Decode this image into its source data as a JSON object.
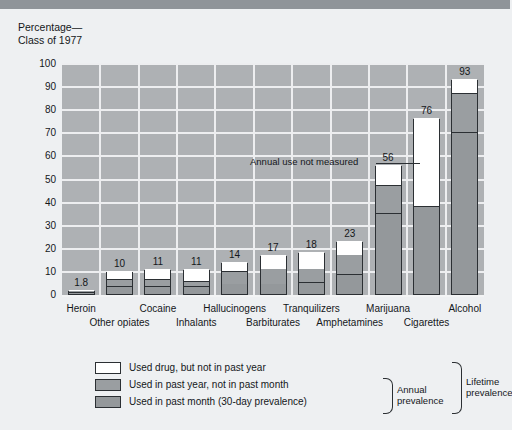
{
  "title": "Percentage—\nClass of 1977",
  "chart_data": {
    "type": "bar",
    "xlabel": "",
    "ylabel": "Percentage—Class of 1977",
    "ylim": [
      0,
      100
    ],
    "yticks": [
      0,
      10,
      20,
      30,
      40,
      50,
      60,
      70,
      80,
      90,
      100
    ],
    "grid": true,
    "stacked": true,
    "legend_position": "below-plot-left",
    "categories": [
      "Heroin",
      "Other opiates",
      "Cocaine",
      "Inhalants",
      "Hallucinogens",
      "Barbiturates",
      "Tranquilizers",
      "Amphetamines",
      "Marijuana",
      "Cigarettes",
      "Alcohol"
    ],
    "lifetime_totals": [
      1.8,
      10,
      11,
      11,
      14,
      17,
      18,
      23,
      56,
      76,
      93
    ],
    "data_labels": [
      "1.8",
      "10",
      "11",
      "11",
      "14",
      "17",
      "18",
      "23",
      "56",
      "76",
      "93"
    ],
    "series": [
      {
        "name": "Used in past month (30-day prevalence)",
        "color": "#94989b",
        "values": [
          0.8,
          3.5,
          3.5,
          3.5,
          4.5,
          4.5,
          5.0,
          8.5,
          35.0,
          38.0,
          70.0
        ]
      },
      {
        "name": "Used in past year, not in past month",
        "color": "#9a9ea1",
        "values": [
          0.6,
          3.0,
          3.0,
          2.0,
          5.5,
          6.5,
          6.0,
          8.5,
          12.0,
          0.0,
          17.0
        ]
      },
      {
        "name": "Used drug, but not in past year",
        "color": "#ffffff",
        "values": [
          0.4,
          3.5,
          4.5,
          5.5,
          4.0,
          6.0,
          7.0,
          6.0,
          9.0,
          38.0,
          6.0
        ]
      }
    ],
    "annotations": [
      {
        "text": "Annual use not measured",
        "target_category": "Cigarettes"
      }
    ]
  },
  "legend": {
    "items": [
      {
        "label": "Used drug, but not in past year",
        "swatch": "white"
      },
      {
        "label": "Used in past year, not in past month",
        "swatch": "gray-year"
      },
      {
        "label": "Used in past month (30-day prevalence)",
        "swatch": "gray-month"
      }
    ],
    "brace_annual": "Annual\nprevalence",
    "brace_lifetime": "Lifetime\nprevalence"
  },
  "colors": {
    "plot_background": "#aeb1b4",
    "page_background": "#eef0f2",
    "grid": "#edeef0",
    "outline": "#2b2f33",
    "segment_white": "#ffffff",
    "segment_year": "#9a9ea1",
    "segment_month": "#94989b",
    "top_band": "#8f9499"
  }
}
